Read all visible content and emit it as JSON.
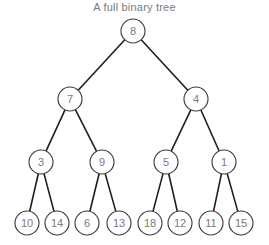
{
  "title": "A full binary tree",
  "style": {
    "edge_color": "#1e1e1e",
    "node_stroke": "#3a3a3a",
    "node_fill": "#ffffff",
    "label_color": "#7a7a7a",
    "node_radius": 12
  },
  "nodes": [
    {
      "id": "n8",
      "label": "8",
      "x": 133,
      "y": 31
    },
    {
      "id": "n7",
      "label": "7",
      "x": 70,
      "y": 99
    },
    {
      "id": "n4",
      "label": "4",
      "x": 196,
      "y": 99
    },
    {
      "id": "n3",
      "label": "3",
      "x": 41,
      "y": 162
    },
    {
      "id": "n9",
      "label": "9",
      "x": 102,
      "y": 162
    },
    {
      "id": "n5",
      "label": "5",
      "x": 166,
      "y": 162
    },
    {
      "id": "n1",
      "label": "1",
      "x": 224,
      "y": 162
    },
    {
      "id": "n10",
      "label": "10",
      "x": 27,
      "y": 223
    },
    {
      "id": "n14",
      "label": "14",
      "x": 57,
      "y": 223
    },
    {
      "id": "n6",
      "label": "6",
      "x": 87,
      "y": 223
    },
    {
      "id": "n13",
      "label": "13",
      "x": 119,
      "y": 223
    },
    {
      "id": "n18",
      "label": "18",
      "x": 150,
      "y": 223
    },
    {
      "id": "n12",
      "label": "12",
      "x": 180,
      "y": 223
    },
    {
      "id": "n11",
      "label": "11",
      "x": 211,
      "y": 223
    },
    {
      "id": "n15",
      "label": "15",
      "x": 241,
      "y": 223
    }
  ],
  "edges": [
    [
      "n8",
      "n7"
    ],
    [
      "n8",
      "n4"
    ],
    [
      "n7",
      "n3"
    ],
    [
      "n7",
      "n9"
    ],
    [
      "n4",
      "n5"
    ],
    [
      "n4",
      "n1"
    ],
    [
      "n3",
      "n10"
    ],
    [
      "n3",
      "n14"
    ],
    [
      "n9",
      "n6"
    ],
    [
      "n9",
      "n13"
    ],
    [
      "n5",
      "n18"
    ],
    [
      "n5",
      "n12"
    ],
    [
      "n1",
      "n11"
    ],
    [
      "n1",
      "n15"
    ]
  ]
}
